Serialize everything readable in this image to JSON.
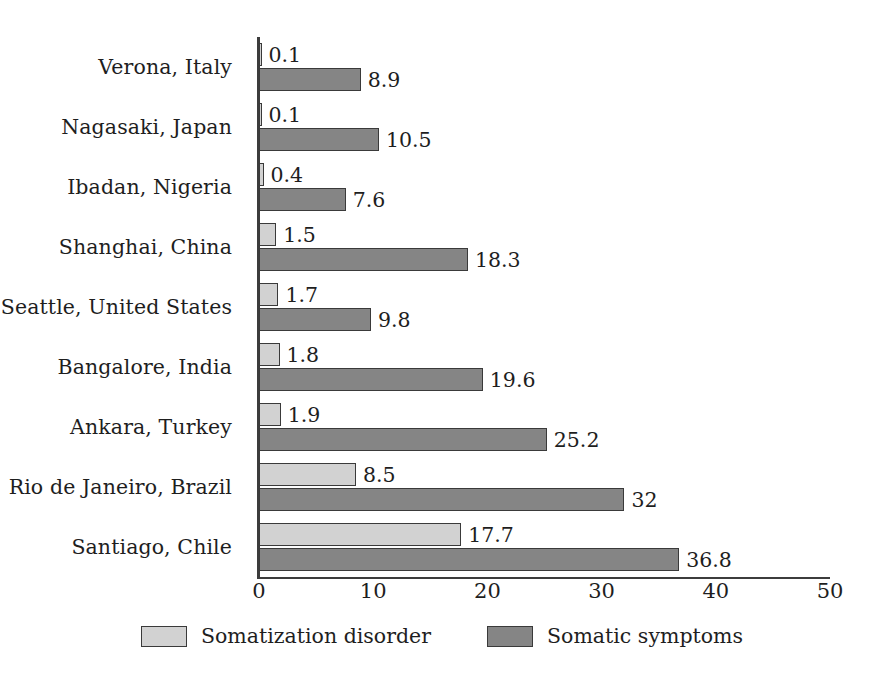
{
  "chart_data": {
    "type": "bar",
    "orientation": "horizontal",
    "title": "",
    "subtitle": "",
    "xlabel": "",
    "ylabel": "",
    "xlim": [
      0,
      50
    ],
    "xticks": [
      0,
      10,
      20,
      30,
      40,
      50
    ],
    "xtick_labels": [
      "0",
      "10",
      "20",
      "30",
      "40",
      "50"
    ],
    "grid": false,
    "legend_position": "bottom-center",
    "categories": [
      "Verona, Italy",
      "Nagasaki, Japan",
      "Ibadan, Nigeria",
      "Shanghai, China",
      "Seattle, United States",
      "Bangalore, India",
      "Ankara, Turkey",
      "Rio de Janeiro, Brazil",
      "Santiago, Chile"
    ],
    "series": [
      {
        "name": "Somatization disorder",
        "color": "#d2d2d2",
        "values": [
          0.1,
          0.1,
          0.4,
          1.5,
          1.7,
          1.8,
          1.9,
          8.5,
          17.7
        ],
        "value_labels": [
          "0.1",
          "0.1",
          "0.4",
          "1.5",
          "1.7",
          "1.8",
          "1.9",
          "8.5",
          "17.7"
        ]
      },
      {
        "name": "Somatic symptoms",
        "color": "#858585",
        "values": [
          8.9,
          10.5,
          7.6,
          18.3,
          9.8,
          19.6,
          25.2,
          32,
          36.8
        ],
        "value_labels": [
          "8.9",
          "10.5",
          "7.6",
          "18.3",
          "9.8",
          "19.6",
          "25.2",
          "32",
          "36.8"
        ]
      }
    ]
  },
  "legend": {
    "items": [
      {
        "label": "Somatization disorder",
        "swatch": "light"
      },
      {
        "label": "Somatic symptoms",
        "swatch": "dark"
      }
    ]
  },
  "colors": {
    "series_light": "#d2d2d2",
    "series_dark": "#858585",
    "axis": "#3c3c3c",
    "text": "#1e1e1e",
    "background": "#ffffff"
  }
}
